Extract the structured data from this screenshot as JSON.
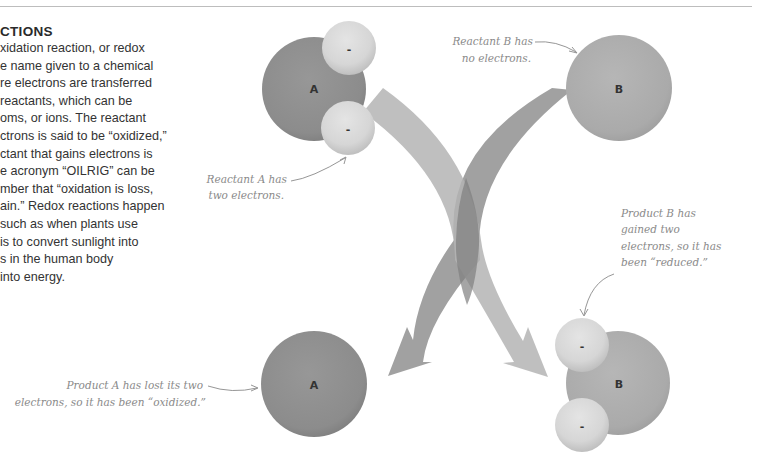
{
  "section": {
    "heading": "CTIONS",
    "body_lines": [
      "xidation reaction, or redox",
      "e name given to a chemical",
      "re electrons are transferred",
      " reactants, which can be",
      "oms, or ions. The reactant",
      "ctrons is said to be “oxidized,”",
      "ctant that gains electrons is",
      "e acronym “OILRIG” can be",
      "mber that “oxidation is loss,",
      "ain.” Redox reactions happen",
      " such as when plants use",
      "is to convert sunlight into",
      "s in the human body",
      " into energy."
    ]
  },
  "atoms": {
    "reactant_a": {
      "label": "A",
      "electrons": [
        "-",
        "-"
      ]
    },
    "reactant_b": {
      "label": "B",
      "electrons": []
    },
    "product_a": {
      "label": "A",
      "electrons": []
    },
    "product_b": {
      "label": "B",
      "electrons": [
        "-",
        "-"
      ]
    }
  },
  "annotations": {
    "reactant_a": [
      "Reactant A has",
      "two electrons."
    ],
    "reactant_b": [
      "Reactant B has",
      "no electrons."
    ],
    "product_a": [
      "Product A has lost its two",
      "electrons, so it has been “oxidized.”"
    ],
    "product_b": [
      "Product B has",
      "gained two",
      "electrons, so it has",
      "been “reduced.”"
    ]
  },
  "colors": {
    "atom_a": "#8e8e8e",
    "atom_b": "#adadad",
    "electron": "#d6d6d6",
    "arrow_a": "#999999",
    "arrow_b": "#b3b3b3",
    "arrow_overlap": "#7d7d7d",
    "annotation_text": "#8a8a8a"
  }
}
